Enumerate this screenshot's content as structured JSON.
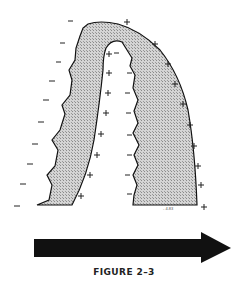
{
  "figure": {
    "caption": "FIGURE 2–3",
    "signature": "- 4.83",
    "colors": {
      "shading": "#c8c8c8",
      "outline": "#111111",
      "arrow": "#111111"
    },
    "outer_left_charge": "−",
    "outer_right_charge": "+",
    "inner_left_charge": "+",
    "inner_right_charge": "−"
  }
}
